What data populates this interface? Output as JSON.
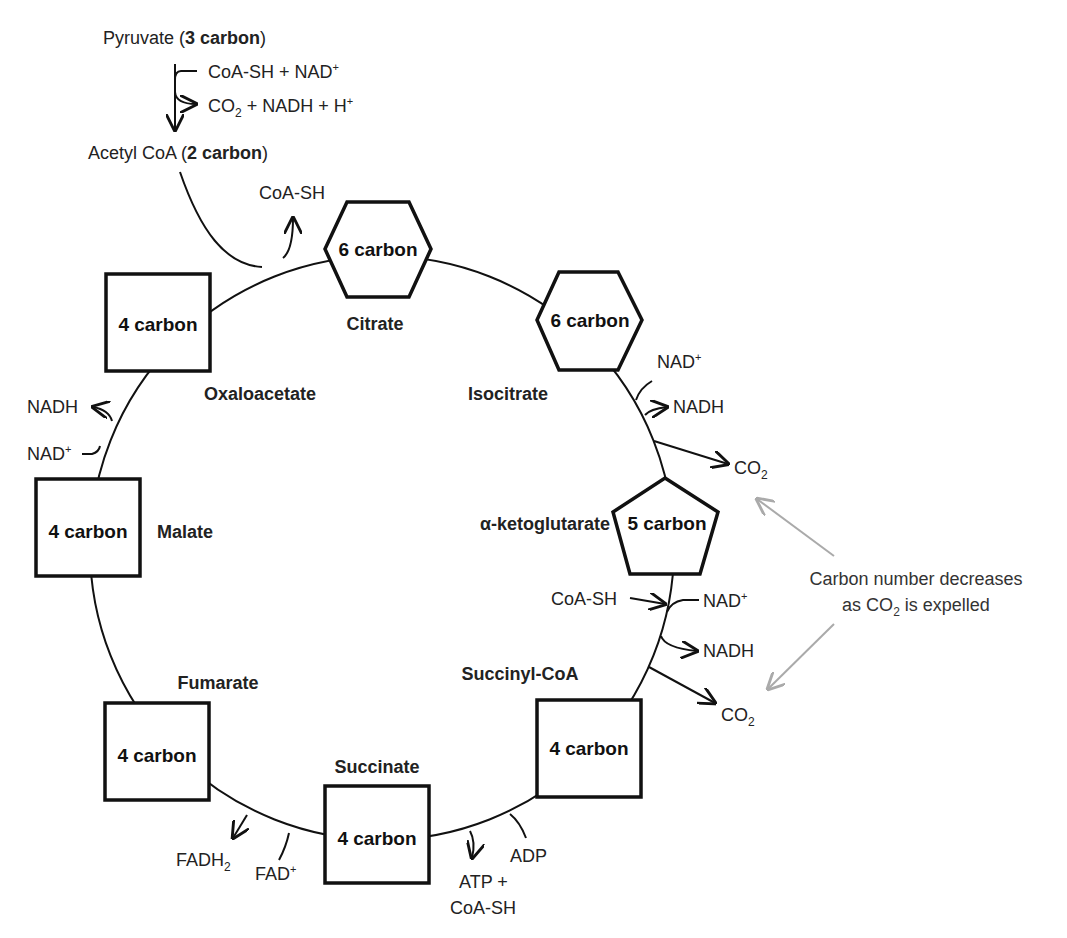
{
  "header": {
    "pyruvate": {
      "name": "Pyruvate (",
      "carbon": "3 carbon",
      "close": ")"
    },
    "pdh_inputs": {
      "text": "CoA-SH + NAD",
      "sup": "+"
    },
    "pdh_outputs": {
      "co": "CO",
      "sub": "2",
      "rest": " + NADH + H",
      "sup": "+"
    },
    "acetyl_coa": {
      "name": "Acetyl CoA (",
      "carbon": "2 carbon",
      "close": ")"
    },
    "coa_release": "CoA-SH"
  },
  "intermediates": [
    {
      "id": "citrate",
      "name": "Citrate",
      "carbons": "6 carbon",
      "shape": "hexagon"
    },
    {
      "id": "isocitrate",
      "name": "Isocitrate",
      "carbons": "6 carbon",
      "shape": "hexagon"
    },
    {
      "id": "alpha-ketoglutarate",
      "name": "α-ketoglutarate",
      "carbons": "5 carbon",
      "shape": "pentagon"
    },
    {
      "id": "succinyl-coa",
      "name": "Succinyl-CoA",
      "carbons": "4 carbon",
      "shape": "square"
    },
    {
      "id": "succinate",
      "name": "Succinate",
      "carbons": "4 carbon",
      "shape": "square"
    },
    {
      "id": "fumarate",
      "name": "Fumarate",
      "carbons": "4 carbon",
      "shape": "square"
    },
    {
      "id": "malate",
      "name": "Malate",
      "carbons": "4 carbon",
      "shape": "square"
    },
    {
      "id": "oxaloacetate",
      "name": "Oxaloacetate",
      "carbons": "4 carbon",
      "shape": "square"
    }
  ],
  "side_reactions": {
    "isocitrate_step": {
      "in": "NAD",
      "in_sup": "+",
      "out": "NADH",
      "co2": "CO",
      "co2_sub": "2"
    },
    "akg_step": {
      "in1": "CoA-SH",
      "in2": "NAD",
      "in2_sup": "+",
      "out": "NADH",
      "co2": "CO",
      "co2_sub": "2"
    },
    "succinyl_step": {
      "in": "ADP",
      "out1": "ATP +",
      "out2": "CoA-SH"
    },
    "succinate_step": {
      "in": "FAD",
      "in_sup": "+",
      "out": "FADH",
      "out_sub": "2"
    },
    "malate_step": {
      "in": "NAD",
      "in_sup": "+",
      "out": "NADH"
    }
  },
  "annotation": {
    "line1": "Carbon number decreases",
    "line2_a": "as CO",
    "line2_sub": "2",
    "line2_b": " is expelled",
    "arrow_color": "#aaaaaa"
  }
}
